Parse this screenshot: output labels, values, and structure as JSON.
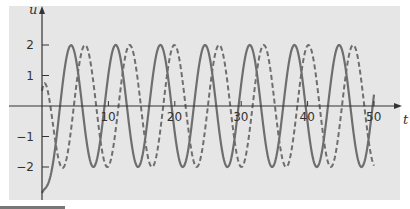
{
  "chart_data": {
    "type": "line",
    "title": "",
    "xlabel": "t",
    "ylabel": "u",
    "xlim": [
      0,
      50
    ],
    "ylim": [
      -2.9,
      2.9
    ],
    "x_ticks": [
      10,
      20,
      30,
      40,
      50
    ],
    "x_tick_labels": [
      "10",
      "20",
      "30",
      "40",
      "50"
    ],
    "y_ticks": [
      -2,
      -1,
      1,
      2
    ],
    "y_tick_labels": [
      "−2",
      "−1",
      "1",
      "2"
    ],
    "grid": false,
    "legend": null,
    "colors": {
      "background": "#e6e6e6",
      "curves": "#6e6e6e",
      "axes": "#333333"
    },
    "series": [
      {
        "name": "solid",
        "style": "solid",
        "description": "Steady-state oscillation amplitude 2, period ≈ 6.7, starting at u ≈ -2.85",
        "t_step": 0.25,
        "t_start": 0,
        "t_end": 50,
        "model": {
          "amplitude": 2,
          "omega": 0.9336,
          "peak_t": 4.37,
          "transient_amp": -1.67,
          "decay": 1.2
        }
      },
      {
        "name": "dashed",
        "style": "dashed",
        "description": "Same oscillation lagging by ≈ 2.1 time units (quarter period), starting at u ≈ 0.5",
        "t_step": 0.25,
        "t_start": 0,
        "t_end": 50,
        "model": {
          "amplitude": 2,
          "omega": 0.9336,
          "peak_t": 6.48,
          "transient_amp": -1.45,
          "decay": 1.2
        }
      }
    ],
    "key_points": {
      "solid": [
        [
          0,
          -2.85
        ],
        [
          4.37,
          2
        ],
        [
          7.7,
          -2
        ],
        [
          11.0,
          2
        ],
        [
          17.8,
          2
        ],
        [
          24.5,
          2
        ],
        [
          31.3,
          2
        ],
        [
          38.0,
          2
        ],
        [
          44.8,
          2
        ],
        [
          48.5,
          -2
        ],
        [
          50,
          -0.8
        ]
      ],
      "dashed": [
        [
          0,
          0.5
        ],
        [
          3.8,
          -1.4
        ],
        [
          6.5,
          2
        ],
        [
          9.8,
          -2
        ],
        [
          13.2,
          2
        ],
        [
          46.9,
          2
        ],
        [
          50,
          -1.9
        ]
      ]
    }
  },
  "axes": {
    "x_label": "t",
    "y_label": "u"
  }
}
